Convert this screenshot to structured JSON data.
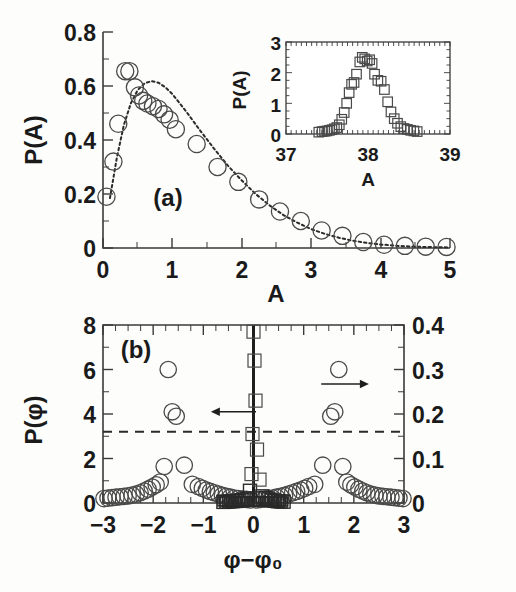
{
  "figure": {
    "title": "",
    "panel_a_tag": "(a)",
    "panel_b_tag": "(b)"
  },
  "chart_data": [
    {
      "id": "panel_a",
      "type": "scatter",
      "title": "(a)",
      "xlabel": "A",
      "ylabel": "P(A)",
      "xlim": [
        0,
        5
      ],
      "ylim": [
        0,
        0.8
      ],
      "xticks": [
        0,
        1,
        2,
        3,
        4,
        5
      ],
      "xtick_labels": [
        "0",
        "1",
        "2",
        "3",
        "4",
        "5"
      ],
      "yticks": [
        0,
        0.2,
        0.4,
        0.6,
        0.8
      ],
      "ytick_labels": [
        "0",
        "0.2",
        "0.4",
        "0.6",
        "0.8"
      ],
      "xminor_step": 0.25,
      "yminor_step": 0.05,
      "grid": false,
      "legend": "none",
      "series": [
        {
          "name": "P(A) data",
          "marker": "open-circle",
          "x": [
            0.05,
            0.15,
            0.22,
            0.32,
            0.38,
            0.46,
            0.52,
            0.58,
            0.64,
            0.72,
            0.8,
            0.88,
            0.96,
            1.05,
            1.35,
            1.65,
            1.95,
            2.25,
            2.55,
            2.85,
            3.15,
            3.45,
            3.75,
            4.05,
            4.35,
            4.65,
            4.95
          ],
          "y": [
            0.19,
            0.32,
            0.46,
            0.655,
            0.655,
            0.595,
            0.565,
            0.545,
            0.535,
            0.525,
            0.515,
            0.495,
            0.475,
            0.44,
            0.385,
            0.3,
            0.245,
            0.18,
            0.135,
            0.1,
            0.065,
            0.045,
            0.022,
            0.012,
            0.008,
            0.005,
            0.004
          ]
        },
        {
          "name": "fit curve",
          "marker": "dashed-line",
          "x": [
            0.1,
            0.2,
            0.3,
            0.4,
            0.5,
            0.6,
            0.7,
            0.8,
            0.9,
            1.0,
            1.2,
            1.4,
            1.6,
            1.8,
            2.0,
            2.2,
            2.4,
            2.6,
            2.8,
            3.0,
            3.2,
            3.4,
            3.6,
            3.8,
            4.0,
            4.3,
            4.6,
            5.0
          ],
          "y": [
            0.185,
            0.335,
            0.455,
            0.535,
            0.585,
            0.61,
            0.618,
            0.612,
            0.595,
            0.57,
            0.505,
            0.435,
            0.368,
            0.305,
            0.25,
            0.2,
            0.158,
            0.122,
            0.094,
            0.07,
            0.052,
            0.038,
            0.027,
            0.019,
            0.013,
            0.007,
            0.004,
            0.002
          ]
        }
      ]
    },
    {
      "id": "panel_a_inset",
      "type": "scatter",
      "title": "",
      "xlabel": "A",
      "ylabel": "P(A)",
      "xlim": [
        37,
        39
      ],
      "ylim": [
        0,
        3
      ],
      "xticks": [
        37,
        38,
        39
      ],
      "xtick_labels": [
        "37",
        "38",
        "39"
      ],
      "yticks": [
        0,
        1,
        2,
        3
      ],
      "ytick_labels": [
        "0",
        "1",
        "2",
        "3"
      ],
      "xminor_step": 0.05,
      "yminor_step": 0.25,
      "grid": false,
      "legend": "none",
      "series": [
        {
          "name": "P(A) inset data",
          "marker": "open-square",
          "x": [
            37.4,
            37.44,
            37.47,
            37.5,
            37.53,
            37.56,
            37.59,
            37.62,
            37.65,
            37.68,
            37.71,
            37.74,
            37.77,
            37.8,
            37.83,
            37.86,
            37.9,
            37.93,
            37.96,
            37.99,
            38.02,
            38.05,
            38.08,
            38.12,
            38.16,
            38.2,
            38.24,
            38.28,
            38.32,
            38.36,
            38.4,
            38.44,
            38.48,
            38.52,
            38.56,
            38.6
          ],
          "y": [
            0.06,
            0.08,
            0.09,
            0.1,
            0.12,
            0.14,
            0.17,
            0.21,
            0.3,
            0.48,
            0.7,
            1.0,
            1.35,
            1.62,
            1.68,
            1.95,
            2.35,
            2.5,
            2.45,
            2.38,
            2.42,
            2.3,
            1.95,
            1.75,
            1.72,
            1.45,
            1.05,
            0.72,
            0.5,
            0.35,
            0.24,
            0.18,
            0.15,
            0.12,
            0.1,
            0.08
          ]
        }
      ]
    },
    {
      "id": "panel_b",
      "type": "scatter",
      "title": "(b)",
      "xlabel": "φ−φ₀",
      "ylabel": "P(φ)",
      "ylabel_right": "",
      "xlim": [
        -3,
        3
      ],
      "ylim": [
        0,
        8
      ],
      "ylim_right": [
        0,
        0.4
      ],
      "xticks": [
        -3,
        -2,
        -1,
        0,
        1,
        2,
        3
      ],
      "xtick_labels": [
        "−3",
        "−2",
        "−1",
        "0",
        "1",
        "2",
        "3"
      ],
      "yticks": [
        0,
        2,
        4,
        6,
        8
      ],
      "ytick_labels": [
        "0",
        "2",
        "4",
        "6",
        "8"
      ],
      "yticks_right": [
        0,
        0.1,
        0.2,
        0.3,
        0.4
      ],
      "ytick_labels_right": [
        "0",
        "0.1",
        "0.2",
        "0.3",
        "0.4"
      ],
      "xminor_step": 0.25,
      "yminor_step": 0.5,
      "grid": false,
      "legend": "none",
      "annotations": [
        {
          "type": "dashed-hline",
          "y": 3.2,
          "label": "threshold"
        },
        {
          "type": "arrow",
          "direction": "left",
          "x_from": 0.05,
          "x_to": -0.85,
          "y": 4.1,
          "points_to": "left-axis"
        },
        {
          "type": "arrow",
          "direction": "right",
          "x_from": 1.35,
          "x_to": 2.3,
          "y": 5.35,
          "points_to": "right-axis"
        }
      ],
      "series": [
        {
          "name": "P(phi) circles (right axis)",
          "marker": "open-circle",
          "axis": "right",
          "x": [
            -2.98,
            -2.9,
            -2.82,
            -2.74,
            -2.66,
            -2.58,
            -2.5,
            -2.42,
            -2.34,
            -2.26,
            -2.18,
            -2.1,
            -2.02,
            -1.94,
            -1.86,
            -1.78,
            -1.7,
            -1.62,
            -1.54,
            -1.38,
            -1.22,
            -1.1,
            -1.02,
            -0.94,
            -0.86,
            -0.78,
            -0.7,
            -0.62,
            -0.54,
            -0.46,
            -0.38,
            -0.3,
            -0.22,
            -0.14,
            -0.06,
            0.06,
            0.14,
            0.22,
            0.3,
            0.38,
            0.46,
            0.54,
            0.62,
            0.7,
            0.78,
            0.86,
            0.94,
            1.02,
            1.1,
            1.22,
            1.38,
            1.54,
            1.62,
            1.7,
            1.78,
            1.86,
            1.94,
            2.02,
            2.1,
            2.18,
            2.26,
            2.34,
            2.42,
            2.5,
            2.58,
            2.66,
            2.74,
            2.82,
            2.9,
            2.98
          ],
          "y": [
            0.01,
            0.011,
            0.012,
            0.013,
            0.014,
            0.015,
            0.016,
            0.018,
            0.02,
            0.023,
            0.027,
            0.031,
            0.036,
            0.041,
            0.047,
            0.082,
            0.3,
            0.205,
            0.195,
            0.085,
            0.042,
            0.037,
            0.033,
            0.029,
            0.026,
            0.023,
            0.02,
            0.017,
            0.015,
            0.013,
            0.011,
            0.01,
            0.009,
            0.008,
            0.007,
            0.007,
            0.008,
            0.009,
            0.01,
            0.011,
            0.013,
            0.015,
            0.017,
            0.02,
            0.023,
            0.026,
            0.029,
            0.033,
            0.037,
            0.042,
            0.085,
            0.195,
            0.205,
            0.3,
            0.082,
            0.047,
            0.041,
            0.036,
            0.031,
            0.027,
            0.023,
            0.02,
            0.018,
            0.016,
            0.015,
            0.014,
            0.013,
            0.012,
            0.011,
            0.01
          ]
        },
        {
          "name": "P(phi) squares (left axis, central spike)",
          "marker": "open-square",
          "axis": "left",
          "x": [
            -0.6,
            -0.54,
            -0.48,
            -0.42,
            -0.36,
            -0.3,
            -0.24,
            -0.18,
            -0.12,
            -0.07,
            -0.04,
            -0.02,
            0.0,
            0.02,
            0.04,
            0.07,
            0.12,
            0.18,
            0.24,
            0.3,
            0.36,
            0.42,
            0.48,
            0.54,
            0.6
          ],
          "y": [
            0.05,
            0.06,
            0.07,
            0.08,
            0.09,
            0.1,
            0.12,
            0.15,
            0.2,
            0.55,
            1.3,
            3.1,
            7.7,
            6.4,
            4.6,
            2.4,
            1.05,
            0.3,
            0.22,
            0.16,
            0.12,
            0.1,
            0.08,
            0.07,
            0.06
          ]
        }
      ]
    }
  ]
}
